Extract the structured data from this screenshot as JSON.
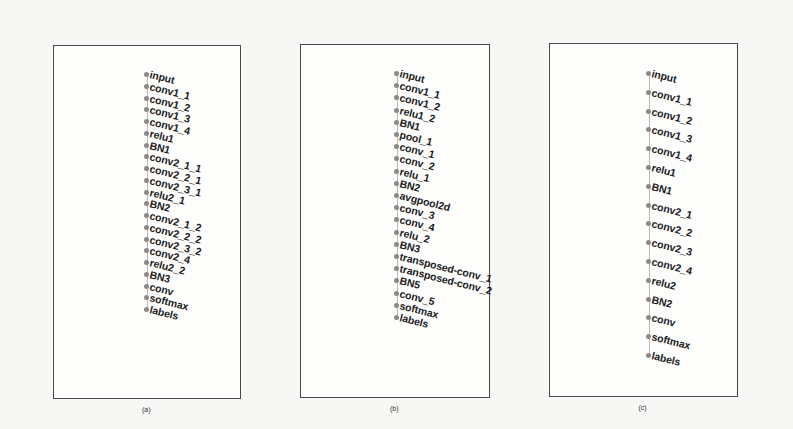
{
  "figure": {
    "panels": [
      {
        "id": "a",
        "caption": "(a)",
        "frame": {
          "left": 53,
          "top": 45,
          "width": 188,
          "height": 354
        },
        "spine_x": 93,
        "first_y": 29,
        "spacing": 11.75,
        "nodes": [
          "input",
          "conv1_1",
          "conv1_2",
          "conv1_3",
          "conv1_4",
          "relu1",
          "BN1",
          "conv2_1_1",
          "conv2_2_1",
          "conv2_3_1",
          "relu2_1",
          "BN2",
          "conv2_1_2",
          "conv2_2_2",
          "conv2_3_2",
          "conv2_4",
          "relu2_2",
          "BN3",
          "conv",
          "softmax",
          "labels"
        ]
      },
      {
        "id": "b",
        "caption": "(b)",
        "frame": {
          "left": 300,
          "top": 44,
          "width": 190,
          "height": 354
        },
        "spine_x": 96,
        "first_y": 29,
        "spacing": 12.2,
        "nodes": [
          "input",
          "conv1_1",
          "conv1_2",
          "relu1_2",
          "BN1",
          "pool_1",
          "conv_1",
          "conv_2",
          "relu_1",
          "BN2",
          "avgpool2d",
          "conv_3",
          "conv_4",
          "relu_2",
          "BN3",
          "transposed-conv_1",
          "transposed-conv_2",
          "BN5",
          "conv_5",
          "softmax",
          "labels"
        ]
      },
      {
        "id": "c",
        "caption": "(c)",
        "frame": {
          "left": 549,
          "top": 43,
          "width": 189,
          "height": 354
        },
        "spine_x": 99,
        "first_y": 30,
        "spacing": 18.8,
        "nodes": [
          "input",
          "conv1_1",
          "conv1_2",
          "conv1_3",
          "conv1_4",
          "relu1",
          "BN1",
          "conv2_1",
          "conv2_2",
          "conv2_3",
          "conv2_4",
          "relu2",
          "BN2",
          "conv",
          "softmax",
          "labels"
        ]
      }
    ]
  },
  "colors": {
    "frame": "#4a4a4a",
    "dot": "#8a8a8a",
    "spine": "#b8b8b8",
    "label": "#1c1c1c"
  }
}
